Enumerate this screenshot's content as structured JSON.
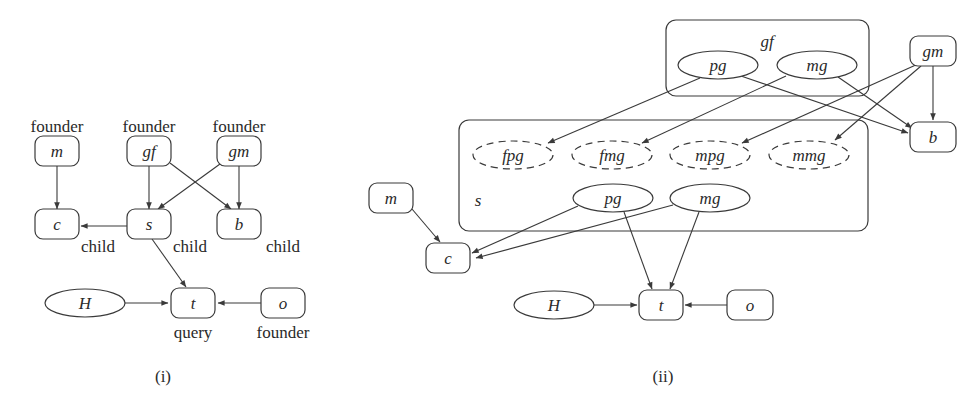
{
  "figure": {
    "panels": [
      {
        "id": "i",
        "caption": "(i)",
        "caption_pos": [
          163,
          382
        ],
        "nodes": [
          {
            "id": "m",
            "label": "m",
            "shape": "rect",
            "x": 57,
            "y": 151,
            "w": 44,
            "h": 30,
            "tag": "founder",
            "tag_pos": [
              57,
              128
            ]
          },
          {
            "id": "gf",
            "label": "gf",
            "shape": "rect",
            "x": 149,
            "y": 151,
            "w": 44,
            "h": 30,
            "tag": "founder",
            "tag_pos": [
              149,
              128
            ]
          },
          {
            "id": "gm",
            "label": "gm",
            "shape": "rect",
            "x": 239,
            "y": 151,
            "w": 44,
            "h": 30,
            "tag": "founder",
            "tag_pos": [
              239,
              128
            ]
          },
          {
            "id": "c",
            "label": "c",
            "shape": "rect",
            "x": 57,
            "y": 224,
            "w": 44,
            "h": 30,
            "tag": "child",
            "tag_pos": [
              98,
              248
            ]
          },
          {
            "id": "s",
            "label": "s",
            "shape": "rect",
            "x": 149,
            "y": 224,
            "w": 44,
            "h": 30,
            "tag": "child",
            "tag_pos": [
              190,
              248
            ]
          },
          {
            "id": "b",
            "label": "b",
            "shape": "rect",
            "x": 239,
            "y": 224,
            "w": 44,
            "h": 30,
            "tag": "child",
            "tag_pos": [
              283,
              248
            ]
          },
          {
            "id": "H",
            "label": "H",
            "shape": "ellipse",
            "x": 85,
            "y": 303,
            "w": 80,
            "h": 28
          },
          {
            "id": "t",
            "label": "t",
            "shape": "rect",
            "x": 193,
            "y": 303,
            "w": 44,
            "h": 30,
            "tag": "query",
            "tag_pos": [
              193,
              334
            ]
          },
          {
            "id": "o",
            "label": "o",
            "shape": "rect",
            "x": 283,
            "y": 303,
            "w": 44,
            "h": 30,
            "tag": "founder",
            "tag_pos": [
              283,
              334
            ]
          }
        ],
        "edges": [
          {
            "from": [
              57,
              166
            ],
            "to": [
              57,
              209
            ]
          },
          {
            "from": [
              149,
              166
            ],
            "to": [
              149,
              209
            ]
          },
          {
            "from": [
              239,
              166
            ],
            "to": [
              239,
              209
            ]
          },
          {
            "from": [
              170,
              163
            ],
            "to": [
              231,
              209
            ]
          },
          {
            "from": [
              220,
              164
            ],
            "to": [
              158,
              209
            ]
          },
          {
            "from": [
              127,
              226
            ],
            "to": [
              81,
              226
            ]
          },
          {
            "from": [
              152,
              239
            ],
            "to": [
              186,
              287
            ]
          },
          {
            "from": [
              125,
              303
            ],
            "to": [
              168,
              303
            ]
          },
          {
            "from": [
              261,
              303
            ],
            "to": [
              218,
              303
            ]
          }
        ]
      },
      {
        "id": "ii",
        "caption": "(ii)",
        "caption_pos": [
          663,
          382
        ],
        "clusters": [
          {
            "id": "gf-cluster",
            "label": "gf",
            "label_pos": [
              767,
              47
            ],
            "x": 666,
            "y": 20,
            "w": 203,
            "h": 76
          },
          {
            "id": "s-cluster",
            "label": "s",
            "label_pos": [
              478,
              206
            ],
            "x": 459,
            "y": 120,
            "w": 409,
            "h": 111
          }
        ],
        "nodes": [
          {
            "id": "pg-gf",
            "label": "pg",
            "shape": "ellipse",
            "x": 718,
            "y": 65,
            "w": 80,
            "h": 28
          },
          {
            "id": "mg-gf",
            "label": "mg",
            "shape": "ellipse",
            "x": 817,
            "y": 65,
            "w": 80,
            "h": 28
          },
          {
            "id": "gm",
            "label": "gm",
            "shape": "rect",
            "x": 933,
            "y": 51,
            "w": 46,
            "h": 30
          },
          {
            "id": "b",
            "label": "b",
            "shape": "rect",
            "x": 933,
            "y": 137,
            "w": 46,
            "h": 30
          },
          {
            "id": "fpg",
            "label": "fpg",
            "shape": "ellipse",
            "dashed": true,
            "x": 513,
            "y": 155,
            "w": 80,
            "h": 28
          },
          {
            "id": "fmg",
            "label": "fmg",
            "shape": "ellipse",
            "dashed": true,
            "x": 612,
            "y": 155,
            "w": 80,
            "h": 28
          },
          {
            "id": "mpg",
            "label": "mpg",
            "shape": "ellipse",
            "dashed": true,
            "x": 710,
            "y": 155,
            "w": 80,
            "h": 28
          },
          {
            "id": "mmg",
            "label": "mmg",
            "shape": "ellipse",
            "dashed": true,
            "x": 809,
            "y": 155,
            "w": 80,
            "h": 28
          },
          {
            "id": "pg-s",
            "label": "pg",
            "shape": "ellipse",
            "x": 613,
            "y": 198,
            "w": 80,
            "h": 28
          },
          {
            "id": "mg-s",
            "label": "mg",
            "shape": "ellipse",
            "x": 710,
            "y": 198,
            "w": 80,
            "h": 28
          },
          {
            "id": "m",
            "label": "m",
            "shape": "rect",
            "x": 391,
            "y": 198,
            "w": 44,
            "h": 30
          },
          {
            "id": "c",
            "label": "c",
            "shape": "rect",
            "x": 448,
            "y": 258,
            "w": 44,
            "h": 30
          },
          {
            "id": "H",
            "label": "H",
            "shape": "ellipse",
            "x": 554,
            "y": 305,
            "w": 80,
            "h": 28
          },
          {
            "id": "t",
            "label": "t",
            "shape": "rect",
            "x": 661,
            "y": 305,
            "w": 44,
            "h": 30
          },
          {
            "id": "o",
            "label": "o",
            "shape": "rect",
            "x": 750,
            "y": 305,
            "w": 46,
            "h": 30
          }
        ],
        "edges": [
          {
            "from": [
              700,
              78
            ],
            "to": [
              548,
              143
            ]
          },
          {
            "from": [
              786,
              76
            ],
            "to": [
              642,
              143
            ]
          },
          {
            "from": [
              918,
              64
            ],
            "to": [
              742,
              143
            ]
          },
          {
            "from": [
              921,
              66
            ],
            "to": [
              835,
              140
            ]
          },
          {
            "from": [
              741,
              76
            ],
            "to": [
              908,
              133
            ]
          },
          {
            "from": [
              838,
              77
            ],
            "to": [
              912,
              128
            ]
          },
          {
            "from": [
              933,
              66
            ],
            "to": [
              933,
              120
            ]
          },
          {
            "from": [
              412,
              209
            ],
            "to": [
              440,
              242
            ]
          },
          {
            "from": [
              578,
              206
            ],
            "to": [
              472,
              253
            ]
          },
          {
            "from": [
              673,
              205
            ],
            "to": [
              476,
              258
            ]
          },
          {
            "from": [
              624,
              212
            ],
            "to": [
              652,
              289
            ]
          },
          {
            "from": [
              699,
              212
            ],
            "to": [
              670,
              289
            ]
          },
          {
            "from": [
              594,
              305
            ],
            "to": [
              637,
              305
            ]
          },
          {
            "from": [
              727,
              305
            ],
            "to": [
              685,
              305
            ]
          }
        ]
      }
    ]
  }
}
